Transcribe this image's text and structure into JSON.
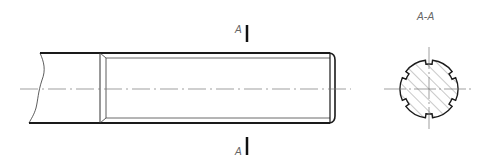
{
  "drawing": {
    "type": "technical-drawing",
    "subject": "splined shaft end with section view",
    "section_marker_top": "A",
    "section_marker_bottom": "A",
    "section_view_title": "A-A"
  },
  "colors": {
    "outline": "#1a1a1a",
    "thin_line": "#555555",
    "centerline": "#777777",
    "hatch": "#777777",
    "label": "#666666",
    "background": "#ffffff"
  }
}
